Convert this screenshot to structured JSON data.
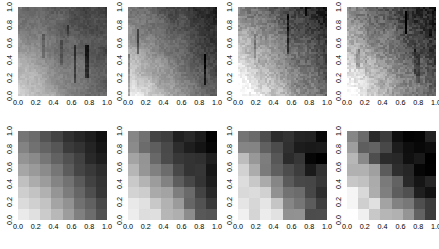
{
  "figure": {
    "width": 439,
    "height": 249,
    "background_color": "#ffffff",
    "rows": 2,
    "cols": 4,
    "panel_count": 8
  },
  "axes": {
    "xticks": [
      "0.0",
      "0.2",
      "0.4",
      "0.6",
      "0.8",
      "1.0"
    ],
    "yticks": [
      "1.0",
      "0.8",
      "0.6",
      "0.4",
      "0.2",
      "0.0"
    ],
    "xlim": [
      0.0,
      1.0
    ],
    "ylim": [
      0.0,
      1.0
    ],
    "xlabel": "",
    "ylabel": "",
    "ytick_rotation_deg": -90,
    "tick_font_size_px": 7.2,
    "tick_color": "#000000"
  },
  "chart_data": {
    "type": "heatmap",
    "title": "",
    "xlabel": "",
    "ylabel": "",
    "xlim": [
      0.0,
      1.0
    ],
    "ylim": [
      0.0,
      1.0
    ],
    "grid": false,
    "legend": "none",
    "colormap": "gray_reversed",
    "value_range": [
      0.0,
      1.0
    ],
    "panels": [
      {
        "index": 0,
        "row": 0,
        "col": 0,
        "resolution": 40,
        "style": "fine",
        "noise": 0.035,
        "streaks": 0.55,
        "field": "corner_gradient_bottomleft_light",
        "vmin": 0.3,
        "vmax": 0.8,
        "tilt": 0.2,
        "radial": 0.55
      },
      {
        "index": 1,
        "row": 0,
        "col": 1,
        "resolution": 40,
        "style": "fine",
        "noise": 0.045,
        "streaks": 0.35,
        "field": "corner_gradient_bottomleft_light",
        "vmin": 0.18,
        "vmax": 0.9,
        "tilt": 0.35,
        "radial": 0.45
      },
      {
        "index": 2,
        "row": 0,
        "col": 2,
        "resolution": 40,
        "style": "fine",
        "noise": 0.075,
        "streaks": 0.3,
        "field": "corner_gradient_bottomleft_light",
        "vmin": 0.05,
        "vmax": 0.95,
        "tilt": 0.55,
        "radial": 0.3
      },
      {
        "index": 3,
        "row": 0,
        "col": 3,
        "resolution": 40,
        "style": "fine",
        "noise": 0.085,
        "streaks": 0.65,
        "field": "corner_gradient_bottomleft_light",
        "vmin": 0.08,
        "vmax": 0.95,
        "tilt": 0.6,
        "radial": 0.25
      },
      {
        "index": 4,
        "row": 1,
        "col": 0,
        "resolution": 8,
        "style": "coarse",
        "noise": 0.02,
        "streaks": 0.0,
        "field": "corner_gradient_bottomleft_light",
        "vmin": 0.12,
        "vmax": 0.92,
        "tilt": 0.3,
        "radial": 0.5
      },
      {
        "index": 5,
        "row": 1,
        "col": 1,
        "resolution": 8,
        "style": "coarse",
        "noise": 0.05,
        "streaks": 0.0,
        "field": "corner_gradient_bottomleft_light",
        "vmin": 0.08,
        "vmax": 0.95,
        "tilt": 0.35,
        "radial": 0.45
      },
      {
        "index": 6,
        "row": 1,
        "col": 2,
        "resolution": 8,
        "style": "coarse",
        "noise": 0.1,
        "streaks": 0.0,
        "field": "corner_gradient_bottomleft_light",
        "vmin": 0.05,
        "vmax": 0.97,
        "tilt": 0.45,
        "radial": 0.35
      },
      {
        "index": 7,
        "row": 1,
        "col": 3,
        "resolution": 8,
        "style": "coarse",
        "noise": 0.12,
        "streaks": 0.0,
        "field": "corner_gradient_bottomleft_light",
        "vmin": 0.05,
        "vmax": 0.97,
        "tilt": 0.5,
        "radial": 0.3
      }
    ],
    "panel_grids": {
      "4": [
        [
          0.55,
          0.6,
          0.66,
          0.74,
          0.8,
          0.86,
          0.9,
          0.93
        ],
        [
          0.5,
          0.55,
          0.61,
          0.68,
          0.75,
          0.81,
          0.86,
          0.9
        ],
        [
          0.42,
          0.47,
          0.54,
          0.62,
          0.69,
          0.76,
          0.82,
          0.87
        ],
        [
          0.34,
          0.39,
          0.47,
          0.55,
          0.63,
          0.71,
          0.78,
          0.84
        ],
        [
          0.26,
          0.31,
          0.39,
          0.48,
          0.57,
          0.66,
          0.74,
          0.81
        ],
        [
          0.19,
          0.24,
          0.31,
          0.4,
          0.5,
          0.6,
          0.69,
          0.77
        ],
        [
          0.14,
          0.18,
          0.25,
          0.34,
          0.44,
          0.54,
          0.64,
          0.73
        ],
        [
          0.1,
          0.14,
          0.2,
          0.28,
          0.38,
          0.49,
          0.59,
          0.69
        ]
      ],
      "5": [
        [
          0.52,
          0.6,
          0.7,
          0.78,
          0.84,
          0.88,
          0.92,
          0.96
        ],
        [
          0.46,
          0.54,
          0.64,
          0.73,
          0.8,
          0.85,
          0.89,
          0.93
        ],
        [
          0.38,
          0.46,
          0.56,
          0.66,
          0.74,
          0.81,
          0.86,
          0.9
        ],
        [
          0.3,
          0.37,
          0.47,
          0.58,
          0.68,
          0.76,
          0.82,
          0.87
        ],
        [
          0.22,
          0.28,
          0.38,
          0.49,
          0.6,
          0.7,
          0.78,
          0.84
        ],
        [
          0.16,
          0.21,
          0.29,
          0.4,
          0.52,
          0.63,
          0.73,
          0.8
        ],
        [
          0.11,
          0.15,
          0.22,
          0.32,
          0.44,
          0.56,
          0.67,
          0.76
        ],
        [
          0.08,
          0.11,
          0.16,
          0.25,
          0.36,
          0.49,
          0.61,
          0.72
        ]
      ],
      "6": [
        [
          0.48,
          0.62,
          0.74,
          0.8,
          0.86,
          0.9,
          0.94,
          0.97
        ],
        [
          0.4,
          0.54,
          0.68,
          0.76,
          0.83,
          0.88,
          0.92,
          0.95
        ],
        [
          0.32,
          0.44,
          0.58,
          0.7,
          0.78,
          0.84,
          0.89,
          0.93
        ],
        [
          0.24,
          0.34,
          0.47,
          0.61,
          0.72,
          0.8,
          0.86,
          0.9
        ],
        [
          0.17,
          0.24,
          0.36,
          0.5,
          0.63,
          0.74,
          0.82,
          0.87
        ],
        [
          0.12,
          0.17,
          0.26,
          0.39,
          0.54,
          0.67,
          0.77,
          0.84
        ],
        [
          0.08,
          0.11,
          0.18,
          0.29,
          0.44,
          0.59,
          0.71,
          0.8
        ],
        [
          0.05,
          0.08,
          0.12,
          0.21,
          0.34,
          0.5,
          0.64,
          0.75
        ]
      ],
      "7": [
        [
          0.45,
          0.64,
          0.76,
          0.82,
          0.88,
          0.92,
          0.95,
          0.98
        ],
        [
          0.37,
          0.55,
          0.7,
          0.78,
          0.85,
          0.9,
          0.93,
          0.96
        ],
        [
          0.29,
          0.44,
          0.6,
          0.72,
          0.8,
          0.86,
          0.9,
          0.94
        ],
        [
          0.22,
          0.33,
          0.48,
          0.63,
          0.74,
          0.82,
          0.87,
          0.91
        ],
        [
          0.15,
          0.23,
          0.35,
          0.51,
          0.65,
          0.76,
          0.83,
          0.88
        ],
        [
          0.1,
          0.15,
          0.25,
          0.39,
          0.55,
          0.68,
          0.78,
          0.85
        ],
        [
          0.07,
          0.1,
          0.17,
          0.28,
          0.44,
          0.6,
          0.72,
          0.81
        ],
        [
          0.05,
          0.07,
          0.11,
          0.2,
          0.33,
          0.5,
          0.65,
          0.76
        ]
      ]
    }
  }
}
